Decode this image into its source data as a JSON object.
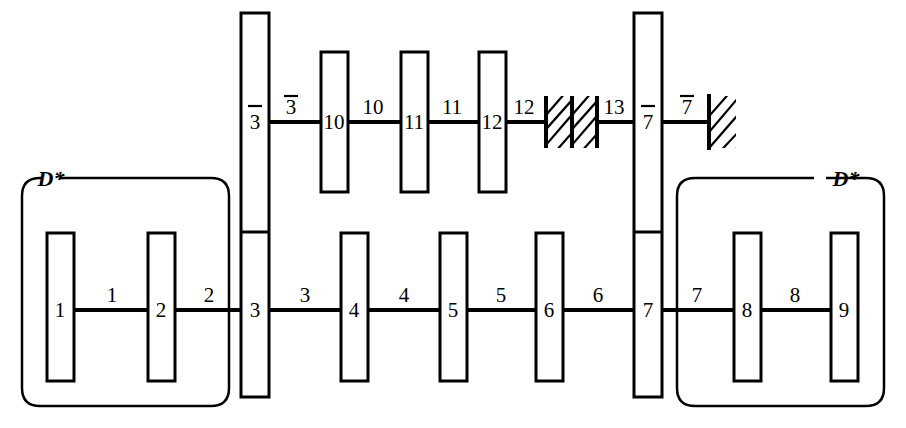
{
  "diagram": {
    "colors": {
      "stroke": "#000000",
      "background": "#ffffff"
    },
    "rows": {
      "upper": {
        "nodes": [
          {
            "id": "n3bar",
            "label": "3",
            "overbar": true
          },
          {
            "id": "n10",
            "label": "10",
            "overbar": false
          },
          {
            "id": "n11",
            "label": "11",
            "overbar": false
          },
          {
            "id": "n12",
            "label": "12",
            "overbar": false
          },
          {
            "id": "n7bar",
            "label": "7",
            "overbar": true
          }
        ],
        "edges": [
          {
            "id": "e3bar",
            "label": "3",
            "overbar": true
          },
          {
            "id": "e10",
            "label": "10",
            "overbar": false
          },
          {
            "id": "e11",
            "label": "11",
            "overbar": false
          },
          {
            "id": "e12",
            "label": "12",
            "overbar": false
          },
          {
            "id": "e13",
            "label": "13",
            "overbar": false
          },
          {
            "id": "e7bar",
            "label": "7",
            "overbar": true
          }
        ],
        "grounds": [
          {
            "id": "ground-middle",
            "kind": "double-hatch-block"
          },
          {
            "id": "ground-right",
            "kind": "hatch-wall"
          }
        ]
      },
      "lower": {
        "nodes": [
          {
            "id": "n1",
            "label": "1"
          },
          {
            "id": "n2",
            "label": "2"
          },
          {
            "id": "n3",
            "label": "3"
          },
          {
            "id": "n4",
            "label": "4"
          },
          {
            "id": "n5",
            "label": "5"
          },
          {
            "id": "n6",
            "label": "6"
          },
          {
            "id": "n7",
            "label": "7"
          },
          {
            "id": "n8",
            "label": "8"
          },
          {
            "id": "n9",
            "label": "9"
          }
        ],
        "edges": [
          {
            "id": "e1",
            "label": "1"
          },
          {
            "id": "e2",
            "label": "2"
          },
          {
            "id": "e3",
            "label": "3"
          },
          {
            "id": "e4",
            "label": "4"
          },
          {
            "id": "e5",
            "label": "5"
          },
          {
            "id": "e6",
            "label": "6"
          },
          {
            "id": "e7",
            "label": "7"
          },
          {
            "id": "e8",
            "label": "8"
          }
        ]
      }
    },
    "groups": [
      {
        "id": "group-left",
        "label": "D*"
      },
      {
        "id": "group-right",
        "label": "D*"
      }
    ]
  }
}
